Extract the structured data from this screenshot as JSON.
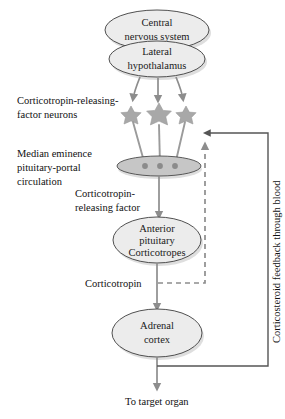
{
  "diagram": {
    "nodes": {
      "cns": {
        "line1": "Central",
        "line2": "nervous system"
      },
      "hypothalamus": {
        "line1": "Lateral",
        "line2": "hypothalamus"
      },
      "median_eminence": {
        "label": ""
      },
      "anterior_pituitary": {
        "line1": "Anterior",
        "line2": "pituitary",
        "line3": "Corticotropes"
      },
      "adrenal": {
        "line1": "Adrenal",
        "line2": "cortex"
      }
    },
    "labels": {
      "crf_neurons_line1": "Corticotropin-releasing-",
      "crf_neurons_line2": "factor neurons",
      "median_eminence_line1": "Median eminence",
      "median_eminence_line2": "pituitary-portal",
      "median_eminence_line3": "circulation",
      "crf_line1": "Corticotropin-",
      "crf_line2": "releasing factor",
      "corticotropin": "Corticotropin",
      "feedback": "Corticosteroid feedback through blood",
      "target_organ": "To target organ"
    },
    "colors": {
      "node_fill": "#ececec",
      "node_stroke": "#3d3d3d",
      "eminence_fill": "#c6c6c6",
      "star_fill": "#a8a8a8",
      "arrow": "#8d8d8d",
      "feedback_line": "#555555",
      "text": "#1a1a1a",
      "background": "#ffffff"
    }
  }
}
